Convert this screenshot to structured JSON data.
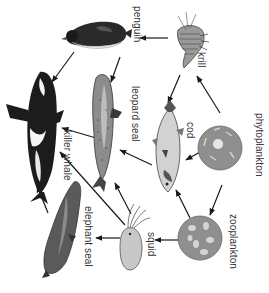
{
  "diagram": {
    "type": "food-web",
    "orientation": "rotated-90-clockwise",
    "colors": {
      "arrow": "#1a1a1a",
      "dark_fill": "#1c1c1c",
      "mid_gray": "#7a7a7a",
      "light_gray": "#c8c8c8",
      "plankton_fill": "#8f8f8f",
      "label": "#333333"
    },
    "nodes": [
      {
        "id": "penguin",
        "label": "penguin"
      },
      {
        "id": "krill",
        "label": "krill"
      },
      {
        "id": "leopard_seal",
        "label": "leopard seal"
      },
      {
        "id": "killer_whale",
        "label": "killer whale"
      },
      {
        "id": "cod",
        "label": "cod"
      },
      {
        "id": "phytoplankton",
        "label": "phytoplankton"
      },
      {
        "id": "zooplankton",
        "label": "zooplankton"
      },
      {
        "id": "squid",
        "label": "squid"
      },
      {
        "id": "elephant_seal",
        "label": "elephant seal"
      }
    ],
    "edges": [
      {
        "from": "krill",
        "to": "penguin"
      },
      {
        "from": "krill",
        "to": "cod"
      },
      {
        "from": "phytoplankton",
        "to": "krill"
      },
      {
        "from": "phytoplankton",
        "to": "cod"
      },
      {
        "from": "phytoplankton",
        "to": "zooplankton"
      },
      {
        "from": "zooplankton",
        "to": "cod"
      },
      {
        "from": "zooplankton",
        "to": "squid"
      },
      {
        "from": "penguin",
        "to": "killer_whale"
      },
      {
        "from": "penguin",
        "to": "leopard_seal"
      },
      {
        "from": "cod",
        "to": "leopard_seal"
      },
      {
        "from": "leopard_seal",
        "to": "killer_whale"
      },
      {
        "from": "squid",
        "to": "leopard_seal"
      },
      {
        "from": "squid",
        "to": "killer_whale"
      },
      {
        "from": "squid",
        "to": "elephant_seal"
      },
      {
        "from": "elephant_seal",
        "to": "killer_whale"
      }
    ]
  }
}
